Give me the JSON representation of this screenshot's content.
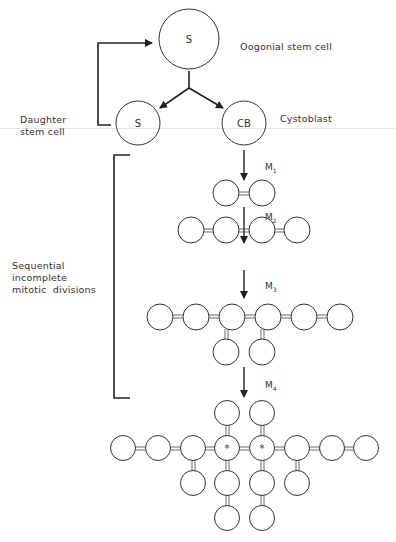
{
  "diagram": {
    "nodes": {
      "stem_cell": {
        "label": "S",
        "caption": "Oogonial stem cell"
      },
      "daughter": {
        "label": "S",
        "caption_line1": "Daughter",
        "caption_line2": "stem cell"
      },
      "cystoblast": {
        "label": "CB",
        "caption": "Cystoblast"
      }
    },
    "divisions": [
      {
        "label": "M",
        "sub": "1",
        "cells": 2
      },
      {
        "label": "M",
        "sub": "2",
        "cells": 4
      },
      {
        "label": "M",
        "sub": "3",
        "cells": 8
      },
      {
        "label": "M",
        "sub": "4",
        "cells": 16
      }
    ],
    "bracket_label": {
      "line1": "Sequential",
      "line2": "incomplete",
      "line3": "mitotic  divisions"
    },
    "marker": "*"
  }
}
